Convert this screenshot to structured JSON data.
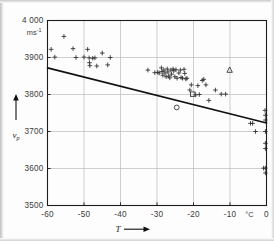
{
  "figure": {
    "background_color": "#fdfdfd",
    "frame_color": "#1c1c1c",
    "grid_color": "#b9b9b9",
    "marker_color": "#2b2b2b",
    "trend_color": "#111111"
  },
  "axes": {
    "y_unit": "ms",
    "y_unit_exponent": "-1",
    "y_title": "v",
    "y_title_sub": "p",
    "x_title": "T",
    "x_unit": "°C",
    "y_ticks": [
      "3500",
      "3600",
      "3700",
      "3800",
      "3900",
      "4 000"
    ],
    "x_ticks": [
      "-60",
      "-50",
      "-40",
      "-30",
      "-20",
      "-10",
      "0"
    ]
  },
  "chart_data": {
    "type": "scatter",
    "title": "",
    "xlabel": "T",
    "ylabel": "v_p",
    "x_unit": "°C",
    "y_unit": "ms^-1",
    "xlim": [
      -60,
      0
    ],
    "ylim": [
      3500,
      4000
    ],
    "xticks": [
      -60,
      -50,
      -40,
      -30,
      -20,
      -10,
      0
    ],
    "yticks": [
      3500,
      3600,
      3700,
      3800,
      3900,
      4000
    ],
    "grid": true,
    "legend": "none",
    "series": [
      {
        "name": "measurements",
        "marker": "plus",
        "points": [
          [
            -59.0,
            3922
          ],
          [
            -58.0,
            3901
          ],
          [
            -55.5,
            3957
          ],
          [
            -53.0,
            3924
          ],
          [
            -52.2,
            3900
          ],
          [
            -50.0,
            3901
          ],
          [
            -49.0,
            3922
          ],
          [
            -48.6,
            3899
          ],
          [
            -48.5,
            3886
          ],
          [
            -48.4,
            3878
          ],
          [
            -47.6,
            3898
          ],
          [
            -47.0,
            3899
          ],
          [
            -46.5,
            3877
          ],
          [
            -45.0,
            3912
          ],
          [
            -43.5,
            3880
          ],
          [
            -42.8,
            3900
          ],
          [
            -32.5,
            3866
          ],
          [
            -30.6,
            3859
          ],
          [
            -29.8,
            3860
          ],
          [
            -29.4,
            3858
          ],
          [
            -28.8,
            3872
          ],
          [
            -28.6,
            3862
          ],
          [
            -28.4,
            3852
          ],
          [
            -28.1,
            3866
          ],
          [
            -27.8,
            3858
          ],
          [
            -27.5,
            3848
          ],
          [
            -27.2,
            3869
          ],
          [
            -27.0,
            3861
          ],
          [
            -26.8,
            3850
          ],
          [
            -26.5,
            3845
          ],
          [
            -26.2,
            3866
          ],
          [
            -26.0,
            3855
          ],
          [
            -25.6,
            3869
          ],
          [
            -25.4,
            3864
          ],
          [
            -25.1,
            3848
          ],
          [
            -24.8,
            3867
          ],
          [
            -24.5,
            3844
          ],
          [
            -24.0,
            3858
          ],
          [
            -23.6,
            3866
          ],
          [
            -23.4,
            3846
          ],
          [
            -23.0,
            3844
          ],
          [
            -22.6,
            3868
          ],
          [
            -22.4,
            3857
          ],
          [
            -22.1,
            3842
          ],
          [
            -21.8,
            3844
          ],
          [
            -21.0,
            3812
          ],
          [
            -20.6,
            3826
          ],
          [
            -19.4,
            3799
          ],
          [
            -18.8,
            3824
          ],
          [
            -18.4,
            3800
          ],
          [
            -17.6,
            3838
          ],
          [
            -17.2,
            3841
          ],
          [
            -16.6,
            3826
          ],
          [
            -15.8,
            3784
          ],
          [
            -14.0,
            3812
          ],
          [
            -12.4,
            3801
          ],
          [
            -11.2,
            3801
          ],
          [
            -4.4,
            3722
          ],
          [
            -3.8,
            3722
          ],
          [
            -3.0,
            3700
          ],
          [
            -0.4,
            3757
          ],
          [
            -0.3,
            3744
          ],
          [
            -0.3,
            3731
          ],
          [
            -0.3,
            3700
          ],
          [
            -0.3,
            3668
          ],
          [
            -0.3,
            3654
          ],
          [
            -0.3,
            3601
          ],
          [
            -0.8,
            3601
          ],
          [
            -0.3,
            3588
          ]
        ]
      },
      {
        "name": "open-square",
        "marker": "square-open",
        "points": [
          [
            -20.2,
            3801
          ]
        ]
      },
      {
        "name": "open-circle",
        "marker": "circle-open",
        "points": [
          [
            -24.6,
            3765
          ]
        ]
      },
      {
        "name": "open-triangle",
        "marker": "triangle-open",
        "points": [
          [
            -10.1,
            3866
          ]
        ]
      }
    ],
    "trend_line": {
      "name": "regression-line",
      "x_start": -60,
      "y_start": 3872,
      "x_end": 0,
      "y_end": 3723
    }
  }
}
